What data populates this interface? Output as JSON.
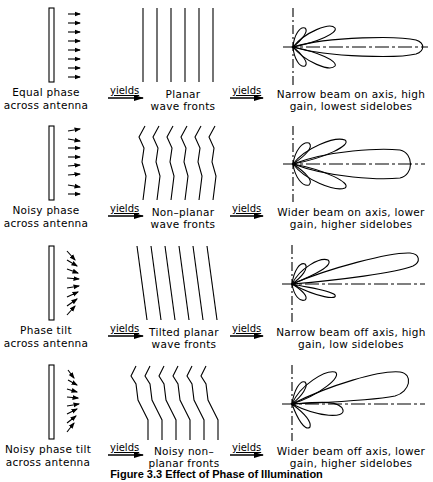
{
  "figure": {
    "caption": "Figure 3.3 Effect of Phase of Illumination",
    "connector_label": "yields",
    "rows": [
      {
        "antenna": [
          "Equal phase",
          "across antenna"
        ],
        "wavefront": [
          "Planar",
          "wave fronts"
        ],
        "pattern": [
          "Narrow beam on axis, high",
          "gain, lowest sidelobes"
        ]
      },
      {
        "antenna": [
          "Noisy phase",
          "across antenna"
        ],
        "wavefront": [
          "Non–planar",
          "wave fronts"
        ],
        "pattern": [
          "Wider beam on axis, lower",
          "gain, higher sidelobes"
        ]
      },
      {
        "antenna": [
          "Phase tilt",
          "across antenna"
        ],
        "wavefront": [
          "Tilted planar",
          "wave fronts"
        ],
        "pattern": [
          "Narrow beam off axis, high",
          "gain, low sidelobes"
        ]
      },
      {
        "antenna": [
          "Noisy phase tilt",
          "across antenna"
        ],
        "wavefront": [
          "Noisy non–",
          "planar fronts"
        ],
        "pattern": [
          "Wider beam off axis, lower",
          "gain, higher sidelobes"
        ]
      }
    ]
  }
}
